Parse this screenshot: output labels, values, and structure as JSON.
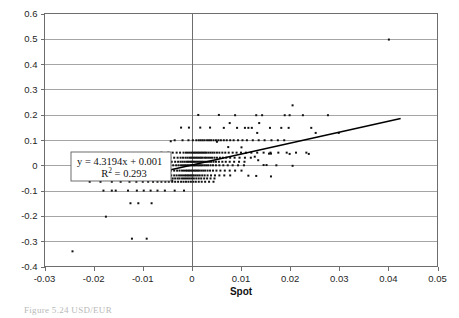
{
  "figure": {
    "caption_fragment": "Figure  5.24   USD/EUR"
  },
  "chart_data": {
    "type": "scatter",
    "title": "",
    "xlabel": "Spot",
    "ylabel": "",
    "xlim": [
      -0.03,
      0.05
    ],
    "ylim": [
      -0.4,
      0.6
    ],
    "xticks": [
      -0.03,
      -0.02,
      -0.01,
      0,
      0.01,
      0.02,
      0.03,
      0.04,
      0.05
    ],
    "xtick_labels": [
      "-0.03",
      "-0.02",
      "-0.01",
      "0",
      "0.01",
      "0.02",
      "0.03",
      "0.04",
      "0.05"
    ],
    "yticks": [
      -0.4,
      -0.3,
      -0.2,
      -0.1,
      0,
      0.1,
      0.2,
      0.3,
      0.4,
      0.5,
      0.6
    ],
    "ytick_labels": [
      "-0.4",
      "-0.3",
      "-0.2",
      "-0.1",
      "0",
      "0.1",
      "0.2",
      "0.3",
      "0.4",
      "0.5",
      "0.6"
    ],
    "grid": "horizontal",
    "legend": "none",
    "marker": "square",
    "marker_size": 2,
    "marker_color": "#111111",
    "annotations": {
      "equation_line1": "y = 4.3194x + 0.001",
      "equation_line2_prefix": "R",
      "equation_line2_exponent": "2",
      "equation_line2_suffix": " = 0.293"
    },
    "trendline": {
      "type": "linear",
      "slope": 4.3194,
      "intercept": 0.001,
      "r_squared": 0.293,
      "x_start": -0.0125,
      "x_end": 0.0425,
      "y_start": -0.053,
      "y_end": 0.185
    },
    "points": [
      [
        0.0401,
        0.497
      ],
      [
        0.0205,
        0.237
      ],
      [
        0.0088,
        0.198
      ],
      [
        0.0131,
        0.198
      ],
      [
        0.0143,
        0.198
      ],
      [
        0.0189,
        0.198
      ],
      [
        0.0199,
        0.198
      ],
      [
        0.0226,
        0.198
      ],
      [
        0.0277,
        0.198
      ],
      [
        0.0013,
        0.199
      ],
      [
        0.0055,
        0.199
      ],
      [
        0.0077,
        0.167
      ],
      [
        0.0137,
        0.167
      ],
      [
        0.0065,
        0.148
      ],
      [
        0.0092,
        0.148
      ],
      [
        0.0108,
        0.148
      ],
      [
        0.0115,
        0.148
      ],
      [
        0.0122,
        0.148
      ],
      [
        0.0159,
        0.148
      ],
      [
        0.0182,
        0.148
      ],
      [
        0.0197,
        0.148
      ],
      [
        0.0243,
        0.148
      ],
      [
        0.0017,
        0.149
      ],
      [
        0.0037,
        0.149
      ],
      [
        -0.0006,
        0.149
      ],
      [
        -0.0022,
        0.149
      ],
      [
        0.0133,
        0.128
      ],
      [
        0.0252,
        0.128
      ],
      [
        0.0299,
        0.128
      ],
      [
        -0.0035,
        0.099
      ],
      [
        -0.0019,
        0.099
      ],
      [
        -0.0007,
        0.099
      ],
      [
        0.0002,
        0.099
      ],
      [
        0.0009,
        0.099
      ],
      [
        0.0014,
        0.099
      ],
      [
        0.0018,
        0.099
      ],
      [
        0.0022,
        0.099
      ],
      [
        0.0026,
        0.099
      ],
      [
        0.0031,
        0.099
      ],
      [
        0.0035,
        0.099
      ],
      [
        0.0039,
        0.099
      ],
      [
        0.0044,
        0.099
      ],
      [
        0.0049,
        0.099
      ],
      [
        0.0054,
        0.099
      ],
      [
        0.0059,
        0.099
      ],
      [
        0.0065,
        0.099
      ],
      [
        0.0071,
        0.099
      ],
      [
        0.0078,
        0.099
      ],
      [
        0.0085,
        0.099
      ],
      [
        0.0094,
        0.099
      ],
      [
        0.0103,
        0.099
      ],
      [
        0.0112,
        0.099
      ],
      [
        0.0124,
        0.099
      ],
      [
        0.0136,
        0.099
      ],
      [
        0.0148,
        0.099
      ],
      [
        0.0162,
        0.099
      ],
      [
        0.0175,
        0.099
      ],
      [
        0.0188,
        0.099
      ],
      [
        -0.0043,
        0.095
      ],
      [
        0.0051,
        0.093
      ],
      [
        -0.0062,
        0.05
      ],
      [
        -0.0048,
        0.05
      ],
      [
        -0.0039,
        0.05
      ],
      [
        -0.0031,
        0.05
      ],
      [
        -0.0024,
        0.05
      ],
      [
        -0.0017,
        0.05
      ],
      [
        -0.0012,
        0.05
      ],
      [
        -0.0008,
        0.05
      ],
      [
        -0.0004,
        0.05
      ],
      [
        0.0,
        0.05
      ],
      [
        0.0003,
        0.05
      ],
      [
        0.0006,
        0.05
      ],
      [
        0.0009,
        0.05
      ],
      [
        0.0012,
        0.05
      ],
      [
        0.0015,
        0.05
      ],
      [
        0.0018,
        0.05
      ],
      [
        0.0021,
        0.05
      ],
      [
        0.0024,
        0.05
      ],
      [
        0.0027,
        0.05
      ],
      [
        0.003,
        0.05
      ],
      [
        0.0034,
        0.05
      ],
      [
        0.0038,
        0.05
      ],
      [
        0.0042,
        0.05
      ],
      [
        0.0046,
        0.05
      ],
      [
        0.0051,
        0.05
      ],
      [
        0.0056,
        0.05
      ],
      [
        0.0062,
        0.05
      ],
      [
        0.0068,
        0.05
      ],
      [
        0.0075,
        0.05
      ],
      [
        0.0083,
        0.05
      ],
      [
        0.0091,
        0.05
      ],
      [
        0.01,
        0.05
      ],
      [
        0.011,
        0.05
      ],
      [
        0.0121,
        0.05
      ],
      [
        0.0133,
        0.05
      ],
      [
        0.0146,
        0.05
      ],
      [
        0.016,
        0.05
      ],
      [
        0.0176,
        0.05
      ],
      [
        0.0193,
        0.05
      ],
      [
        0.0212,
        0.05
      ],
      [
        0.0233,
        0.05
      ],
      [
        0.0157,
        0.046
      ],
      [
        0.0161,
        0.046
      ],
      [
        0.0199,
        0.045
      ],
      [
        0.0238,
        0.045
      ],
      [
        0.0074,
        0.072
      ],
      [
        0.0101,
        0.071
      ],
      [
        -0.0055,
        0.03
      ],
      [
        -0.0044,
        0.03
      ],
      [
        -0.0036,
        0.03
      ],
      [
        -0.0029,
        0.03
      ],
      [
        -0.0023,
        0.03
      ],
      [
        -0.0018,
        0.03
      ],
      [
        -0.0013,
        0.03
      ],
      [
        -0.0009,
        0.03
      ],
      [
        -0.0005,
        0.03
      ],
      [
        -0.0002,
        0.03
      ],
      [
        0.0001,
        0.03
      ],
      [
        0.0004,
        0.03
      ],
      [
        0.0007,
        0.03
      ],
      [
        0.001,
        0.03
      ],
      [
        0.0013,
        0.03
      ],
      [
        0.0016,
        0.03
      ],
      [
        0.0019,
        0.03
      ],
      [
        0.0022,
        0.03
      ],
      [
        0.0026,
        0.03
      ],
      [
        0.0029,
        0.03
      ],
      [
        0.0033,
        0.03
      ],
      [
        0.0037,
        0.03
      ],
      [
        0.0041,
        0.03
      ],
      [
        0.0046,
        0.03
      ],
      [
        0.0051,
        0.03
      ],
      [
        0.0057,
        0.03
      ],
      [
        0.0063,
        0.03
      ],
      [
        0.007,
        0.03
      ],
      [
        0.0078,
        0.03
      ],
      [
        0.0087,
        0.03
      ],
      [
        0.0097,
        0.03
      ],
      [
        0.0108,
        0.03
      ],
      [
        0.012,
        0.03
      ],
      [
        -0.005,
        0.014
      ],
      [
        -0.0041,
        0.014
      ],
      [
        -0.0034,
        0.014
      ],
      [
        -0.0028,
        0.014
      ],
      [
        -0.0023,
        0.014
      ],
      [
        -0.0019,
        0.014
      ],
      [
        -0.0015,
        0.014
      ],
      [
        -0.0011,
        0.014
      ],
      [
        -0.0008,
        0.014
      ],
      [
        -0.0005,
        0.014
      ],
      [
        -0.0002,
        0.014
      ],
      [
        0.0,
        0.014
      ],
      [
        0.0003,
        0.014
      ],
      [
        0.0005,
        0.014
      ],
      [
        0.0008,
        0.014
      ],
      [
        0.0011,
        0.014
      ],
      [
        0.0014,
        0.014
      ],
      [
        0.0017,
        0.014
      ],
      [
        0.002,
        0.014
      ],
      [
        0.0023,
        0.014
      ],
      [
        0.0027,
        0.014
      ],
      [
        0.0031,
        0.014
      ],
      [
        0.0035,
        0.014
      ],
      [
        0.0039,
        0.014
      ],
      [
        0.0044,
        0.014
      ],
      [
        0.0049,
        0.014
      ],
      [
        0.0055,
        0.014
      ],
      [
        0.0062,
        0.014
      ],
      [
        0.0069,
        0.014
      ],
      [
        0.0077,
        0.014
      ],
      [
        0.0086,
        0.014
      ],
      [
        0.0096,
        0.014
      ],
      [
        0.0107,
        0.014
      ],
      [
        -0.0046,
        0.0
      ],
      [
        -0.0038,
        0.0
      ],
      [
        -0.0032,
        0.0
      ],
      [
        -0.0027,
        0.0
      ],
      [
        -0.0022,
        0.0
      ],
      [
        -0.0018,
        0.0
      ],
      [
        -0.0014,
        0.0
      ],
      [
        -0.0011,
        0.0
      ],
      [
        -0.0008,
        0.0
      ],
      [
        -0.0005,
        0.0
      ],
      [
        -0.0002,
        0.0
      ],
      [
        0.0001,
        0.0
      ],
      [
        0.0004,
        0.0
      ],
      [
        0.0006,
        0.0
      ],
      [
        0.0009,
        0.0
      ],
      [
        0.0012,
        0.0
      ],
      [
        0.0015,
        0.0
      ],
      [
        0.0018,
        0.0
      ],
      [
        0.0021,
        0.0
      ],
      [
        0.0025,
        0.0
      ],
      [
        0.0029,
        0.0
      ],
      [
        0.0033,
        0.0
      ],
      [
        0.0038,
        0.0
      ],
      [
        0.0043,
        0.0
      ],
      [
        0.0049,
        0.0
      ],
      [
        0.0056,
        0.0
      ],
      [
        0.0064,
        0.0
      ],
      [
        0.0073,
        0.0
      ],
      [
        0.0083,
        0.0
      ],
      [
        0.0094,
        0.0
      ],
      [
        0.0106,
        0.0
      ],
      [
        0.0146,
        0.001
      ],
      [
        0.0152,
        0.001
      ],
      [
        0.0172,
        0.0
      ],
      [
        0.0205,
        -0.002
      ],
      [
        0.0135,
        0.02
      ],
      [
        0.0128,
        0.034
      ],
      [
        -0.0052,
        -0.021
      ],
      [
        -0.0043,
        -0.021
      ],
      [
        -0.0036,
        -0.021
      ],
      [
        -0.003,
        -0.021
      ],
      [
        -0.0025,
        -0.021
      ],
      [
        -0.002,
        -0.021
      ],
      [
        -0.0016,
        -0.021
      ],
      [
        -0.0012,
        -0.021
      ],
      [
        -0.0009,
        -0.021
      ],
      [
        -0.0006,
        -0.021
      ],
      [
        -0.0003,
        -0.021
      ],
      [
        0.0,
        -0.021
      ],
      [
        0.0003,
        -0.021
      ],
      [
        0.0006,
        -0.021
      ],
      [
        0.0009,
        -0.021
      ],
      [
        0.0012,
        -0.021
      ],
      [
        0.0015,
        -0.021
      ],
      [
        0.0019,
        -0.021
      ],
      [
        0.0023,
        -0.021
      ],
      [
        0.0027,
        -0.021
      ],
      [
        0.0032,
        -0.021
      ],
      [
        0.0037,
        -0.021
      ],
      [
        0.0043,
        -0.021
      ],
      [
        0.005,
        -0.021
      ],
      [
        0.0058,
        -0.021
      ],
      [
        0.0067,
        -0.021
      ],
      [
        0.0077,
        -0.021
      ],
      [
        0.0088,
        -0.021
      ],
      [
        0.0101,
        -0.021
      ],
      [
        -0.0058,
        -0.04
      ],
      [
        -0.0049,
        -0.04
      ],
      [
        -0.0042,
        -0.04
      ],
      [
        -0.0036,
        -0.04
      ],
      [
        -0.0031,
        -0.04
      ],
      [
        -0.0026,
        -0.04
      ],
      [
        -0.0022,
        -0.04
      ],
      [
        -0.0018,
        -0.04
      ],
      [
        -0.0014,
        -0.04
      ],
      [
        -0.0011,
        -0.04
      ],
      [
        -0.0008,
        -0.04
      ],
      [
        -0.0005,
        -0.04
      ],
      [
        -0.0002,
        -0.04
      ],
      [
        0.0001,
        -0.04
      ],
      [
        0.0004,
        -0.04
      ],
      [
        0.0008,
        -0.04
      ],
      [
        0.0012,
        -0.04
      ],
      [
        0.0016,
        -0.04
      ],
      [
        0.0021,
        -0.04
      ],
      [
        0.0026,
        -0.04
      ],
      [
        0.0032,
        -0.04
      ],
      [
        0.0039,
        -0.04
      ],
      [
        0.0047,
        -0.04
      ],
      [
        0.0056,
        -0.04
      ],
      [
        0.0066,
        -0.04
      ],
      [
        0.0078,
        -0.04
      ],
      [
        0.0115,
        -0.041
      ],
      [
        0.0131,
        -0.042
      ],
      [
        0.0161,
        -0.044
      ],
      [
        -0.0225,
        -0.052
      ],
      [
        -0.02,
        -0.052
      ],
      [
        -0.0192,
        -0.052
      ],
      [
        -0.0178,
        -0.052
      ],
      [
        -0.0166,
        -0.052
      ],
      [
        -0.0157,
        -0.052
      ],
      [
        -0.0148,
        -0.052
      ],
      [
        -0.014,
        -0.052
      ],
      [
        -0.0132,
        -0.052
      ],
      [
        -0.0125,
        -0.052
      ],
      [
        -0.0118,
        -0.052
      ],
      [
        -0.0111,
        -0.052
      ],
      [
        -0.0104,
        -0.052
      ],
      [
        -0.0098,
        -0.052
      ],
      [
        -0.0092,
        -0.052
      ],
      [
        -0.0086,
        -0.052
      ],
      [
        -0.008,
        -0.052
      ],
      [
        -0.0074,
        -0.052
      ],
      [
        -0.0069,
        -0.052
      ],
      [
        -0.0064,
        -0.052
      ],
      [
        -0.0059,
        -0.052
      ],
      [
        -0.0054,
        -0.052
      ],
      [
        -0.0049,
        -0.052
      ],
      [
        -0.0044,
        -0.052
      ],
      [
        -0.0039,
        -0.052
      ],
      [
        -0.0034,
        -0.052
      ],
      [
        -0.0029,
        -0.052
      ],
      [
        -0.0025,
        -0.052
      ],
      [
        -0.002,
        -0.052
      ],
      [
        -0.0016,
        -0.052
      ],
      [
        -0.0012,
        -0.052
      ],
      [
        -0.0008,
        -0.052
      ],
      [
        -0.0004,
        -0.052
      ],
      [
        0.0,
        -0.052
      ],
      [
        0.0004,
        -0.052
      ],
      [
        0.0009,
        -0.052
      ],
      [
        0.0014,
        -0.052
      ],
      [
        0.0019,
        -0.052
      ],
      [
        0.0025,
        -0.052
      ],
      [
        0.0031,
        -0.052
      ],
      [
        0.0038,
        -0.052
      ],
      [
        0.0046,
        -0.052
      ],
      [
        -0.0208,
        -0.065
      ],
      [
        -0.0186,
        -0.065
      ],
      [
        -0.0163,
        -0.065
      ],
      [
        -0.0145,
        -0.065
      ],
      [
        -0.0127,
        -0.065
      ],
      [
        -0.0113,
        -0.065
      ],
      [
        -0.01,
        -0.065
      ],
      [
        -0.0089,
        -0.065
      ],
      [
        -0.0079,
        -0.065
      ],
      [
        -0.007,
        -0.065
      ],
      [
        -0.0062,
        -0.065
      ],
      [
        -0.0054,
        -0.065
      ],
      [
        -0.0047,
        -0.065
      ],
      [
        -0.004,
        -0.065
      ],
      [
        -0.0034,
        -0.065
      ],
      [
        -0.0028,
        -0.065
      ],
      [
        -0.0022,
        -0.065
      ],
      [
        -0.0017,
        -0.065
      ],
      [
        -0.0012,
        -0.065
      ],
      [
        -0.0007,
        -0.065
      ],
      [
        -0.0002,
        -0.065
      ],
      [
        0.0003,
        -0.065
      ],
      [
        0.0008,
        -0.065
      ],
      [
        0.0014,
        -0.065
      ],
      [
        0.002,
        -0.065
      ],
      [
        0.0027,
        -0.065
      ],
      [
        0.0035,
        -0.065
      ],
      [
        0.0044,
        -0.065
      ],
      [
        -0.0066,
        -0.058
      ],
      [
        -0.004,
        -0.061
      ],
      [
        -0.018,
        -0.1
      ],
      [
        -0.0163,
        -0.1
      ],
      [
        -0.0155,
        -0.1
      ],
      [
        -0.013,
        -0.1
      ],
      [
        -0.0112,
        -0.1
      ],
      [
        -0.0098,
        -0.1
      ],
      [
        -0.0084,
        -0.1
      ],
      [
        -0.007,
        -0.1
      ],
      [
        -0.0055,
        -0.1
      ],
      [
        -0.0035,
        -0.1
      ],
      [
        -0.0016,
        -0.1
      ],
      [
        -0.0125,
        -0.15
      ],
      [
        -0.0109,
        -0.15
      ],
      [
        -0.0082,
        -0.15
      ],
      [
        -0.0175,
        -0.203
      ],
      [
        -0.0122,
        -0.29
      ],
      [
        -0.0092,
        -0.29
      ],
      [
        -0.0243,
        -0.34
      ]
    ]
  }
}
